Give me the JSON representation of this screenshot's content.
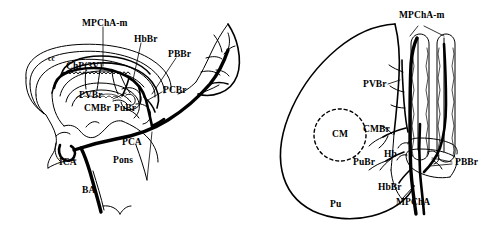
{
  "figure": {
    "background_color": "#ffffff",
    "ink_color": "#000000",
    "panels": [
      {
        "id": "left",
        "name": "midsagittal-view",
        "description": "Mid-sagittal schematic of the brain showing the medial posterior choroidal artery and its branches"
      },
      {
        "id": "right",
        "name": "thalamus-dorsal-view",
        "description": "Dorsal view of the thalamus with choroid plexus of the third ventricle and arterial branches"
      }
    ]
  },
  "left_panel": {
    "labels": [
      {
        "key": "mpcha_m",
        "text": "MPChA-m",
        "x": 82,
        "y": 19,
        "size": "normal"
      },
      {
        "key": "hbbr",
        "text": "HbBr",
        "x": 134,
        "y": 35,
        "size": "normal"
      },
      {
        "key": "pbbr",
        "text": "PBBr",
        "x": 168,
        "y": 50,
        "size": "normal"
      },
      {
        "key": "cc",
        "text": "cc",
        "x": 48,
        "y": 55,
        "size": "small"
      },
      {
        "key": "chp3v",
        "text": "ChP(3V)",
        "x": 66,
        "y": 62,
        "size": "normal"
      },
      {
        "key": "pcbr",
        "text": "PCBr",
        "x": 163,
        "y": 86,
        "size": "normal"
      },
      {
        "key": "pvbr",
        "text": "PVBr",
        "x": 79,
        "y": 91,
        "size": "normal"
      },
      {
        "key": "cmbr",
        "text": "CMBr",
        "x": 84,
        "y": 104,
        "size": "normal"
      },
      {
        "key": "pubr",
        "text": "PuBr",
        "x": 114,
        "y": 104,
        "size": "normal"
      },
      {
        "key": "pca",
        "text": "PCA",
        "x": 122,
        "y": 138,
        "size": "normal"
      },
      {
        "key": "pons",
        "text": "Pons",
        "x": 113,
        "y": 156,
        "size": "normal"
      },
      {
        "key": "ica",
        "text": "ICA",
        "x": 59,
        "y": 158,
        "size": "normal"
      },
      {
        "key": "ba",
        "text": "BA",
        "x": 82,
        "y": 186,
        "size": "normal"
      }
    ]
  },
  "right_panel": {
    "labels": [
      {
        "key": "mpcha_m",
        "text": "MPChA-m",
        "x": 399,
        "y": 18,
        "size": "normal"
      },
      {
        "key": "pvbr",
        "text": "PVBr",
        "x": 363,
        "y": 80,
        "size": "normal"
      },
      {
        "key": "cmbr",
        "text": "CMBr",
        "x": 363,
        "y": 125,
        "size": "normal"
      },
      {
        "key": "cm",
        "text": "CM",
        "x": 332,
        "y": 130,
        "size": "normal"
      },
      {
        "key": "hb",
        "text": "Hb",
        "x": 382,
        "y": 152,
        "size": "normal"
      },
      {
        "key": "pubr",
        "text": "PuBr",
        "x": 355,
        "y": 158,
        "size": "normal"
      },
      {
        "key": "pbbr",
        "text": "PBBr",
        "x": 454,
        "y": 158,
        "size": "normal"
      },
      {
        "key": "hbbr",
        "text": "HbBr",
        "x": 380,
        "y": 184,
        "size": "normal"
      },
      {
        "key": "mpcha",
        "text": "MPChA",
        "x": 398,
        "y": 198,
        "size": "normal"
      },
      {
        "key": "pu",
        "text": "Pu",
        "x": 330,
        "y": 200,
        "size": "normal"
      }
    ]
  },
  "abbreviations": {
    "MPChA": "medial posterior choroidal artery",
    "MPChA-m": "medial posterior choroidal artery main trunk",
    "PCA": "posterior cerebral artery",
    "ICA": "internal carotid artery",
    "BA": "basilar artery",
    "ChP(3V)": "choroid plexus of the third ventricle",
    "cc": "corpus callosum",
    "HbBr": "habenular branch",
    "PBBr": "paraventricular branch",
    "PCBr": "posterior commissure branch",
    "PVBr": "periventricular branch",
    "CMBr": "centromedian branch",
    "PuBr": "pulvinar branch",
    "Hb": "habenula",
    "CM": "centromedian nucleus",
    "Pu": "pulvinar",
    "Pons": "pons"
  }
}
